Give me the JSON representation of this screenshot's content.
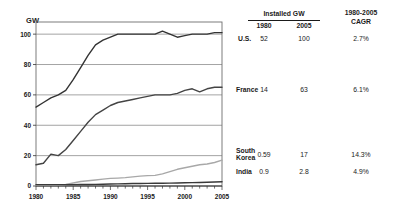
{
  "chart_data": {
    "type": "line",
    "title": "",
    "xlabel": "",
    "ylabel": "GW",
    "xlim": [
      1980,
      2005
    ],
    "ylim": [
      0,
      108
    ],
    "yticks": [
      0,
      20,
      40,
      60,
      80,
      100
    ],
    "xticks": [
      1980,
      1985,
      1990,
      1995,
      2000,
      2005
    ],
    "ytick_labels": [
      "0",
      "20",
      "40",
      "60",
      "80",
      "100"
    ],
    "xtick_labels": [
      "1980",
      "1985",
      "1990",
      "1995",
      "2000",
      "2005"
    ],
    "grid": "horizontal",
    "legend": "none",
    "minor_xticks_every": 1,
    "series": [
      {
        "name": "U.S.",
        "color": "#333333",
        "x": [
          1980,
          1981,
          1982,
          1983,
          1984,
          1985,
          1986,
          1987,
          1988,
          1989,
          1990,
          1991,
          1992,
          1993,
          1994,
          1995,
          1996,
          1997,
          1998,
          1999,
          2000,
          2001,
          2002,
          2003,
          2004,
          2005
        ],
        "values": [
          52,
          55,
          58,
          60,
          63,
          70,
          78,
          86,
          93,
          96,
          98,
          100,
          100,
          100,
          100,
          100,
          100,
          102,
          100,
          98,
          99,
          100,
          100,
          100,
          101,
          101
        ]
      },
      {
        "name": "France",
        "color": "#444444",
        "x": [
          1980,
          1981,
          1982,
          1983,
          1984,
          1985,
          1986,
          1987,
          1988,
          1989,
          1990,
          1991,
          1992,
          1993,
          1994,
          1995,
          1996,
          1997,
          1998,
          1999,
          2000,
          2001,
          2002,
          2003,
          2004,
          2005
        ],
        "values": [
          14,
          15,
          21,
          20,
          24,
          30,
          36,
          42,
          47,
          50,
          53,
          55,
          56,
          57,
          58,
          59,
          60,
          60,
          60,
          61,
          63,
          64,
          62,
          64,
          65,
          65
        ]
      },
      {
        "name": "South Korea",
        "color": "#a8a8a8",
        "x": [
          1980,
          1981,
          1982,
          1983,
          1984,
          1985,
          1986,
          1987,
          1988,
          1989,
          1990,
          1991,
          1992,
          1993,
          1994,
          1995,
          1996,
          1997,
          1998,
          1999,
          2000,
          2001,
          2002,
          2003,
          2004,
          2005
        ],
        "values": [
          0.59,
          0.6,
          0.6,
          0.7,
          1.0,
          2.0,
          3.0,
          3.5,
          4.0,
          4.5,
          5.0,
          5.2,
          5.5,
          6.0,
          6.5,
          6.8,
          7.0,
          8.0,
          9.5,
          11.0,
          12.0,
          13.0,
          14.0,
          14.5,
          15.5,
          17.0
        ]
      },
      {
        "name": "India",
        "color": "#3a3a3a",
        "x": [
          1980,
          1981,
          1982,
          1983,
          1984,
          1985,
          1986,
          1987,
          1988,
          1989,
          1990,
          1991,
          1992,
          1993,
          1994,
          1995,
          1996,
          1997,
          1998,
          1999,
          2000,
          2001,
          2002,
          2003,
          2004,
          2005
        ],
        "values": [
          0.9,
          0.9,
          0.9,
          0.9,
          0.9,
          0.9,
          1.0,
          1.0,
          1.1,
          1.2,
          1.3,
          1.4,
          1.5,
          1.6,
          1.6,
          1.7,
          1.8,
          1.8,
          1.9,
          2.0,
          2.1,
          2.2,
          2.3,
          2.5,
          2.6,
          2.8
        ]
      }
    ]
  },
  "table": {
    "group_header": "Installed GW",
    "cagr_header_line1": "1980-2005",
    "cagr_header_line2": "CAGR",
    "sub_headers": [
      "1980",
      "2005"
    ],
    "rows": [
      {
        "name": "U.S.",
        "name_line1": "U.S.",
        "name_line2": "",
        "y1980": "52",
        "y2005": "100",
        "cagr": "2.7%"
      },
      {
        "name": "France",
        "name_line1": "France",
        "name_line2": "",
        "y1980": "14",
        "y2005": "63",
        "cagr": "6.1%"
      },
      {
        "name": "South Korea",
        "name_line1": "South",
        "name_line2": "Korea",
        "y1980": "0.59",
        "y2005": "17",
        "cagr": "14.3%"
      },
      {
        "name": "India",
        "name_line1": "India",
        "name_line2": "",
        "y1980": "0.9",
        "y2005": "2.8",
        "cagr": "4.9%"
      }
    ]
  }
}
